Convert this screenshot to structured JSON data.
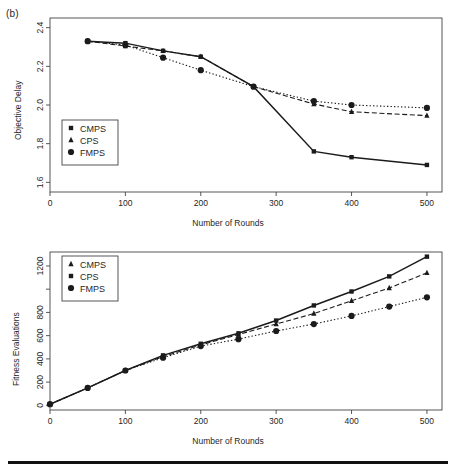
{
  "figure": {
    "panel_label": "(b)"
  },
  "chart_data": [
    {
      "id": "objective-delay",
      "type": "line",
      "title": "",
      "xlabel": "Number of Rounds",
      "ylabel": "Objective Delay",
      "xlim": [
        0,
        520
      ],
      "ylim": [
        1.55,
        2.45
      ],
      "xticks": [
        0,
        100,
        200,
        300,
        400,
        500
      ],
      "xtick_labels": [
        "0",
        "100",
        "200",
        "300",
        "400",
        "500"
      ],
      "yticks": [
        1.6,
        1.8,
        2.0,
        2.2,
        2.4
      ],
      "ytick_labels": [
        "1.6",
        "1.8",
        "2.0",
        "2.2",
        "2.4"
      ],
      "grid": false,
      "legend_position": "left",
      "legend": [
        "CMPS",
        "CPS",
        "FMPS"
      ],
      "x": [
        50,
        100,
        150,
        200,
        270,
        350,
        400,
        500
      ],
      "series": [
        {
          "name": "CMPS",
          "marker": "square",
          "line": "solid",
          "values": [
            2.33,
            2.32,
            2.28,
            2.25,
            2.095,
            1.76,
            1.73,
            1.69
          ]
        },
        {
          "name": "CPS",
          "marker": "triangle",
          "line": "dashed",
          "values": [
            2.33,
            2.305,
            2.28,
            2.25,
            2.095,
            2.005,
            1.965,
            1.945
          ]
        },
        {
          "name": "FMPS",
          "marker": "circle",
          "line": "dotted",
          "values": [
            2.33,
            2.31,
            2.245,
            2.18,
            2.095,
            2.02,
            2.0,
            1.985
          ]
        }
      ]
    },
    {
      "id": "fitness-evaluations",
      "type": "line",
      "title": "",
      "xlabel": "Number of Rounds",
      "ylabel": "Fitness Evaluations",
      "xlim": [
        0,
        520
      ],
      "ylim": [
        -40,
        1320
      ],
      "xticks": [
        0,
        100,
        200,
        300,
        400,
        500
      ],
      "xtick_labels": [
        "0",
        "100",
        "200",
        "300",
        "400",
        "500"
      ],
      "yticks": [
        0,
        200,
        400,
        600,
        800,
        1000,
        1200
      ],
      "ytick_labels": [
        "0",
        "200",
        "400",
        "600",
        "800",
        "",
        "1200"
      ],
      "grid": false,
      "legend_position": "left",
      "legend": [
        "CMPS",
        "CPS",
        "FMPS"
      ],
      "x": [
        0,
        50,
        100,
        150,
        200,
        250,
        300,
        350,
        400,
        450,
        500
      ],
      "series": [
        {
          "name": "CMPS",
          "marker": "triangle",
          "line": "dashed",
          "values": [
            10,
            150,
            300,
            420,
            520,
            610,
            700,
            790,
            900,
            1010,
            1140
          ]
        },
        {
          "name": "CPS",
          "marker": "square",
          "line": "solid",
          "values": [
            10,
            150,
            300,
            430,
            530,
            620,
            730,
            860,
            980,
            1110,
            1280
          ]
        },
        {
          "name": "FMPS",
          "marker": "circle",
          "line": "dotted",
          "values": [
            10,
            150,
            300,
            410,
            510,
            570,
            640,
            700,
            770,
            850,
            930
          ]
        }
      ]
    }
  ]
}
